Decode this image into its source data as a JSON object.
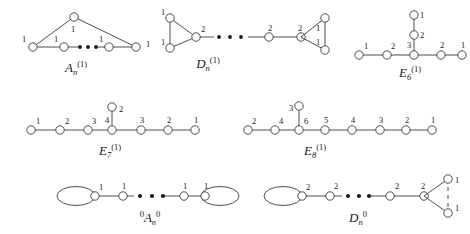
{
  "figure": {
    "background_color": "#ffffff",
    "stroke_color": "#3a3a3a",
    "node_fill": "#ffffff",
    "text_color": "#1a1a1a"
  },
  "diagrams": [
    {
      "id": "A_n_affine",
      "name_base": "A",
      "name_sub": "n",
      "name_sup": "(1)",
      "shape": "cycle-with-apex",
      "node_marks": [
        "1",
        "1",
        "1",
        "1",
        "1"
      ],
      "apex_mark": "1",
      "chain_marks": [
        "1",
        "1",
        "1",
        "1"
      ],
      "ellipsis": true
    },
    {
      "id": "D_n_affine",
      "name_base": "D",
      "name_sub": "n",
      "name_sup": "(1)",
      "shape": "fork-chain-fork",
      "left_fork_marks": [
        "1",
        "1"
      ],
      "chain_marks": [
        "2",
        "2",
        "2"
      ],
      "right_fork_marks": [
        "1",
        "1"
      ],
      "ellipsis": true
    },
    {
      "id": "E6_affine",
      "name_base": "E",
      "name_sub": "6",
      "name_sup": "(1)",
      "shape": "T-shape",
      "horizontal_marks": [
        "1",
        "2",
        "3",
        "2",
        "1"
      ],
      "vertical_marks": [
        "2",
        "1"
      ],
      "ellipsis": false
    },
    {
      "id": "E7_affine",
      "name_base": "E",
      "name_sub": "7",
      "name_sup": "(1)",
      "shape": "T-shape",
      "horizontal_marks": [
        "1",
        "2",
        "3",
        "4",
        "3",
        "2",
        "1"
      ],
      "vertical_marks": [
        "2"
      ],
      "ellipsis": false
    },
    {
      "id": "E8_affine",
      "name_base": "E",
      "name_sub": "8",
      "name_sup": "(1)",
      "shape": "T-shape",
      "horizontal_marks": [
        "2",
        "4",
        "6",
        "5",
        "4",
        "3",
        "2",
        "1"
      ],
      "vertical_marks": [
        "3"
      ],
      "ellipsis": false
    },
    {
      "id": "A_n_zero",
      "name_base": "A",
      "name_sub": "n",
      "name_sup": "0",
      "name_presup": "0",
      "shape": "loop-chain-loop",
      "chain_marks": [
        "1",
        "1",
        "1",
        "1"
      ],
      "ellipsis": true,
      "left_loop": true,
      "right_loop": true
    },
    {
      "id": "D_n_zero",
      "name_base": "D",
      "name_sub": "n",
      "name_sup": "0",
      "shape": "loop-chain-fork",
      "chain_marks": [
        "2",
        "2",
        "2",
        "2"
      ],
      "fork_marks": [
        "1",
        "1"
      ],
      "ellipsis": true,
      "left_loop": true
    }
  ],
  "glyphs": {
    "ellipsis_dot": "•",
    "node_circle": "circle-outline"
  }
}
